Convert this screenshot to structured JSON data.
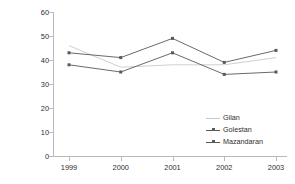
{
  "chart_data": {
    "type": "line",
    "title": "",
    "xlabel": "",
    "ylabel": "Number of wader species",
    "categories": [
      "1999",
      "2000",
      "2001",
      "2002",
      "2003"
    ],
    "x": [
      1999,
      2000,
      2001,
      2002,
      2003
    ],
    "ylim": [
      0,
      60
    ],
    "yticks": [
      0,
      10,
      20,
      30,
      40,
      50,
      60
    ],
    "grid": false,
    "legend_position": "inside-lower-right",
    "series": [
      {
        "name": "Gilan",
        "values": [
          46,
          37,
          38,
          38,
          41
        ],
        "color": "#c9c9c9",
        "marker": "none"
      },
      {
        "name": "Golestan",
        "values": [
          38,
          35,
          43,
          34,
          35
        ],
        "color": "#595959",
        "marker": "square"
      },
      {
        "name": "Mazandaran",
        "values": [
          43,
          41,
          49,
          39,
          44
        ],
        "color": "#595959",
        "marker": "square"
      }
    ]
  },
  "axes": {
    "y_title": "Number of wader species",
    "y_tick_labels": [
      "0",
      "10",
      "20",
      "30",
      "40",
      "50",
      "60"
    ],
    "x_tick_labels": [
      "1999",
      "2000",
      "2001",
      "2002",
      "2003"
    ]
  },
  "legend": {
    "items": [
      {
        "label": "Gilan"
      },
      {
        "label": "Golestan"
      },
      {
        "label": "Mazandaran"
      }
    ]
  },
  "colors": {
    "axis": "#b9b9b9",
    "text": "#2e2e2e",
    "series_light": "#c9c9c9",
    "series_dark": "#595959",
    "background": "#ffffff"
  }
}
